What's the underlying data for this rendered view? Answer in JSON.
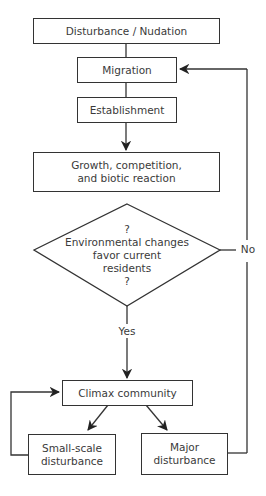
{
  "diagram": {
    "type": "flowchart",
    "nodes": {
      "disturbance": {
        "label": "Disturbance / Nudation"
      },
      "migration": {
        "label": "Migration"
      },
      "establishment": {
        "label": "Establishment"
      },
      "growth": {
        "line1": "Growth, competition,",
        "line2": "and biotic reaction"
      },
      "decision": {
        "q1": "?",
        "line1": "Environmental changes",
        "line2": "favor current",
        "line3": "residents",
        "q2": "?"
      },
      "climax": {
        "label": "Climax community"
      },
      "small_scale": {
        "line1": "Small-scale",
        "line2": "disturbance"
      },
      "major": {
        "line1": "Major",
        "line2": "disturbance"
      }
    },
    "edges": {
      "yes_label": "Yes",
      "no_label": "No"
    },
    "colors": {
      "stroke": "#333333",
      "text": "#3a3a3a",
      "background": "#ffffff"
    }
  }
}
